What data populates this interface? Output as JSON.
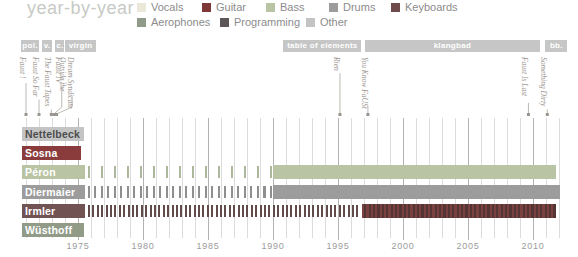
{
  "chart_data": {
    "type": "bar",
    "subtype": "membership-timeline",
    "title": "year-by-year",
    "x_axis": {
      "start": 1970.7,
      "end": 2012.7,
      "tick_years": [
        1975,
        1980,
        1985,
        1990,
        1995,
        2000,
        2005,
        2010
      ]
    },
    "legend": {
      "rows": [
        [
          {
            "label": "Vocals",
            "color": "#ebe8da"
          },
          {
            "label": "Guitar",
            "color": "#7e3737"
          },
          {
            "label": "Bass",
            "color": "#b8c4a3"
          },
          {
            "label": "Drums",
            "color": "#9c9c9c"
          },
          {
            "label": "Keyboards",
            "color": "#6f4a4a"
          }
        ],
        [
          {
            "label": "Aerophones",
            "color": "#8f9b88"
          },
          {
            "label": "Programming",
            "color": "#5d5656"
          },
          {
            "label": "Other",
            "color": "#c4c4c4"
          }
        ]
      ]
    },
    "record_label_eras": [
      {
        "label": "pol.",
        "from": 1970.62,
        "to": 1972.0
      },
      {
        "label": "v.",
        "from": 1972.25,
        "to": 1973.0
      },
      {
        "label": "c.",
        "from": 1973.25,
        "to": 1973.95
      },
      {
        "label": "virgin",
        "from": 1974.0,
        "to": 1976.4
      },
      {
        "label": "table of elements",
        "from": 1990.8,
        "to": 1996.8
      },
      {
        "label": "klangbad",
        "from": 1997.05,
        "to": 2010.55
      },
      {
        "label": "bb.",
        "from": 2010.95,
        "to": 2012.65
      }
    ],
    "albums": [
      {
        "title": "Faust !",
        "label_year": 1971.0,
        "dot_year": 1971.0
      },
      {
        "title": "Faust So Far",
        "label_year": 1972.0,
        "dot_year": 1972.0
      },
      {
        "title": "The Faust Tapes",
        "label_year": 1972.95,
        "dot_year": 1972.95
      },
      {
        "title": "Faust IV",
        "label_year": 1973.75,
        "dot_year": 1973.15
      },
      {
        "title": "Outside the\nDream Syndicate",
        "label_year": 1974.55,
        "dot_year": 1973.35
      },
      {
        "title": "Rien",
        "label_year": 1995.15,
        "dot_year": 1995.15
      },
      {
        "title": "You Know FaUSt",
        "label_year": 1997.3,
        "dot_year": 1997.3
      },
      {
        "title": "Faust Is Last",
        "label_year": 2009.65,
        "dot_year": 2009.65
      },
      {
        "title": "Something Dirty",
        "label_year": 2011.1,
        "dot_year": 2011.1
      }
    ],
    "members": [
      {
        "name": "Nettelbeck",
        "instrument": "Other",
        "name_color": "#4d4d4d",
        "segments": [
          {
            "style": "solid",
            "color": "#c4c4c4",
            "from": 1970.7,
            "to": 1975.45
          }
        ]
      },
      {
        "name": "Sosna",
        "instrument": "Guitar",
        "name_color": "#ffffff",
        "segments": [
          {
            "style": "solid",
            "color": "#8a3c3c",
            "from": 1970.7,
            "to": 1975.2
          }
        ]
      },
      {
        "name": "Péron",
        "instrument": "Bass",
        "name_color": "#ffffff",
        "segments": [
          {
            "style": "solid",
            "color": "#b8c4a3",
            "from": 1970.7,
            "to": 1975.55
          },
          {
            "style": "ticks",
            "color": "#adb79b",
            "from": 1975.8,
            "to": 1989.9,
            "period": 13
          },
          {
            "style": "solid",
            "color": "#b8c4a3",
            "from": 1990.0,
            "to": 2011.75
          }
        ]
      },
      {
        "name": "Diermaier",
        "instrument": "Drums",
        "name_color": "#ffffff",
        "segments": [
          {
            "style": "solid",
            "color": "#9c9c9c",
            "from": 1970.7,
            "to": 1975.55
          },
          {
            "style": "ticks",
            "color": "#8f8f8f",
            "from": 1975.8,
            "to": 1989.9,
            "period": 6.5
          },
          {
            "style": "solid",
            "color": "#9c9c9c",
            "from": 1990.0,
            "to": 2012.1
          }
        ]
      },
      {
        "name": "Irmler",
        "instrument": "Keyboards",
        "name_color": "#ffffff",
        "segments": [
          {
            "style": "solid",
            "color": "#715353",
            "from": 1970.7,
            "to": 1975.55
          },
          {
            "style": "ticks",
            "color": "#624b4b",
            "from": 1975.8,
            "to": 1996.75,
            "period": 4.4
          },
          {
            "style": "striped",
            "color": "#7a4141",
            "color2": "#553434",
            "from": 1996.85,
            "to": 2011.75
          }
        ]
      },
      {
        "name": "Wüsthoff",
        "instrument": "Aerophones",
        "name_color": "#ffffff",
        "segments": [
          {
            "style": "solid",
            "color": "#919b88",
            "from": 1970.7,
            "to": 1975.45
          }
        ]
      }
    ],
    "grid": {
      "minor_color": "#dcdcdc",
      "major_color": "#b3b3b3"
    },
    "annotation_color": "#9b958f"
  }
}
